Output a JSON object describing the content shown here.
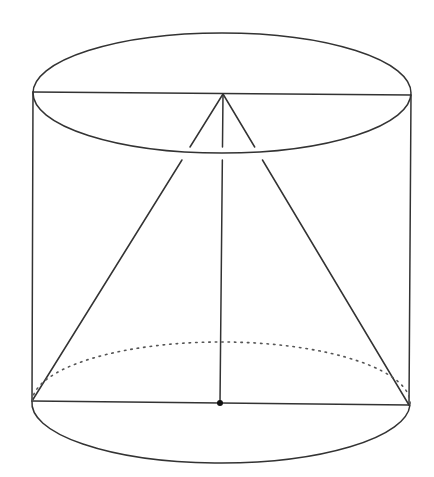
{
  "diagram": {
    "canvas": {
      "width": 434,
      "height": 477,
      "background": "#ffffff"
    },
    "colors": {
      "line": "#333333",
      "dotted": "#555555",
      "point": "#111111"
    },
    "line_width": 1.5,
    "cylinder": {
      "top_ellipse": {
        "cx": 222,
        "cy": 93,
        "rx": 189,
        "ry": 60
      },
      "bottom_ellipse_front_arc": {
        "cx": 221,
        "cy": 403,
        "rx": 189,
        "ry": 60
      },
      "bottom_ellipse_back_arc_dotted": {
        "cx": 221,
        "cy": 403,
        "rx": 189,
        "ry": 61
      },
      "left_side": {
        "x1": 33,
        "y1": 92,
        "x2": 32,
        "y2": 401
      },
      "right_side": {
        "x1": 411,
        "y1": 95,
        "x2": 409,
        "y2": 405
      }
    },
    "top_diameter": {
      "x1": 33,
      "y1": 92,
      "x2": 411,
      "y2": 95
    },
    "bottom_diameter": {
      "x1": 32,
      "y1": 401,
      "x2": 409,
      "y2": 405
    },
    "cone": {
      "apex": {
        "x": 223,
        "y": 94
      },
      "base_left": {
        "x": 32,
        "y": 401
      },
      "base_right": {
        "x": 409,
        "y": 405
      },
      "base_center": {
        "x": 220,
        "y": 403
      }
    },
    "occlusion_gap": {
      "y_start": 147,
      "y_end": 160
    },
    "points": [
      {
        "name": "apex",
        "x": 223,
        "y": 94,
        "marked": false
      },
      {
        "name": "base-center",
        "x": 220,
        "y": 403,
        "marked": true,
        "r": 3
      }
    ]
  }
}
